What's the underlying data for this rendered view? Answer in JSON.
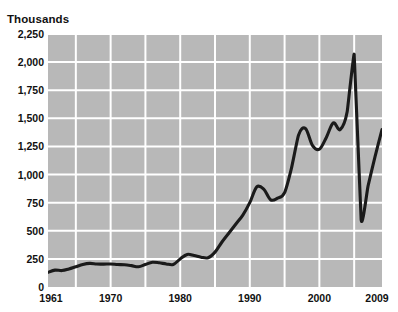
{
  "top_remnant": " ",
  "chart_data": {
    "type": "line",
    "title": "",
    "subtitle": "",
    "xlabel": "",
    "ylabel": "Thousands",
    "ylim": [
      0,
      2250
    ],
    "xlim": [
      1961,
      2009
    ],
    "grid": true,
    "legend": null,
    "y_ticks": [
      0,
      250,
      500,
      750,
      1000,
      1250,
      1500,
      1750,
      2000,
      2250
    ],
    "y_tick_labels": [
      "0",
      "250",
      "500",
      "750",
      "1,000",
      "1,250",
      "1,500",
      "1,750",
      "2,000",
      "2,250"
    ],
    "x_ticks": [
      1961,
      1970,
      1980,
      1990,
      2000,
      2009
    ],
    "x_tick_labels": [
      "1961",
      "1970",
      "1980",
      "1990",
      "2000",
      "2009"
    ],
    "x_gridlines": [
      1965,
      1970,
      1975,
      1980,
      1985,
      1990,
      1995,
      2000,
      2005
    ],
    "colors": {
      "plot_background": "#b8b8b8",
      "gridline": "#ffffff",
      "line": "#1a1a1a",
      "text": "#111111",
      "page_background": "#ffffff"
    },
    "series": [
      {
        "name": "Value",
        "x": [
          1961,
          1962,
          1963,
          1964,
          1965,
          1966,
          1967,
          1968,
          1969,
          1970,
          1971,
          1972,
          1973,
          1974,
          1975,
          1976,
          1977,
          1978,
          1979,
          1980,
          1981,
          1982,
          1983,
          1984,
          1985,
          1986,
          1987,
          1988,
          1989,
          1990,
          1991,
          1992,
          1993,
          1994,
          1995,
          1996,
          1997,
          1998,
          1999,
          2000,
          2001,
          2002,
          2003,
          2004,
          2005,
          2006,
          2007,
          2008,
          2009
        ],
        "values": [
          130,
          150,
          146,
          160,
          180,
          200,
          210,
          205,
          203,
          205,
          200,
          198,
          190,
          180,
          200,
          220,
          215,
          205,
          200,
          250,
          290,
          280,
          265,
          260,
          310,
          400,
          480,
          560,
          640,
          750,
          890,
          870,
          775,
          790,
          840,
          1060,
          1350,
          1410,
          1260,
          1225,
          1330,
          1460,
          1400,
          1560,
          2070,
          600,
          900,
          1160,
          1400
        ]
      }
    ]
  }
}
